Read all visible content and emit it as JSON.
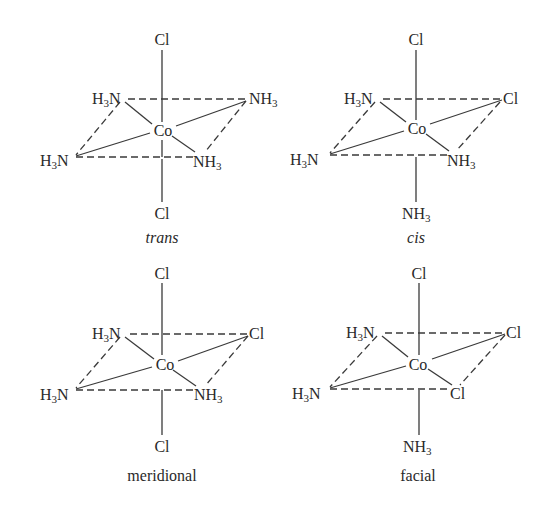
{
  "figure": {
    "panels": [
      {
        "id": "trans",
        "caption": "trans",
        "caption_style": "italic",
        "center": "Co",
        "ligands": {
          "top": "Cl",
          "bottom": "Cl",
          "back_left": "H3N",
          "back_right": "NH3",
          "front_left": "H3N",
          "front_right": "NH3"
        }
      },
      {
        "id": "cis",
        "caption": "cis",
        "caption_style": "italic",
        "center": "Co",
        "ligands": {
          "top": "Cl",
          "bottom": "NH3",
          "back_left": "H3N",
          "back_right": "Cl",
          "front_left": "H3N",
          "front_right": "NH3"
        }
      },
      {
        "id": "meridional",
        "caption": "meridional",
        "caption_style": "normal",
        "center": "Co",
        "ligands": {
          "top": "Cl",
          "bottom": "Cl",
          "back_left": "H3N",
          "back_right": "Cl",
          "front_left": "H3N",
          "front_right": "NH3"
        }
      },
      {
        "id": "facial",
        "caption": "facial",
        "caption_style": "normal",
        "center": "Co",
        "ligands": {
          "top": "Cl",
          "bottom": "NH3",
          "back_left": "H3N",
          "back_right": "Cl",
          "front_left": "H3N",
          "front_right": "Cl"
        }
      }
    ]
  }
}
